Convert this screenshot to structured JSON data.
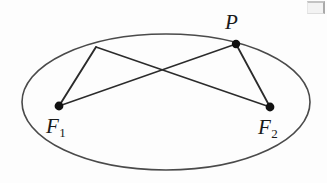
{
  "figure": {
    "type": "geometry-diagram",
    "background_color": "#fdfdfd",
    "stroke_color": "#4a4a4a",
    "line_color": "#2b2b2b",
    "point_color": "#111111",
    "label_color": "#1a1a1a",
    "ellipse": {
      "cx": 166,
      "cy": 102,
      "rx": 144,
      "ry": 68,
      "stroke_width": 1.6
    },
    "points": [
      {
        "id": "P",
        "label": "P",
        "x": 236,
        "y": 44,
        "radius": 4.2,
        "filled": true
      },
      {
        "id": "F1",
        "label": "F",
        "subscript": "1",
        "x": 59,
        "y": 106,
        "radius": 4.4,
        "filled": true
      },
      {
        "id": "F2",
        "label": "F",
        "subscript": "2",
        "x": 270,
        "y": 107,
        "radius": 4.4,
        "filled": true
      },
      {
        "id": "Q",
        "label": "",
        "x": 96,
        "y": 47,
        "radius": 0,
        "filled": false
      }
    ],
    "segments": [
      {
        "name": "segment-Q-F1",
        "from": "Q",
        "to": "F1",
        "x1": 96,
        "y1": 47,
        "x2": 59,
        "y2": 106,
        "width": 1.7
      },
      {
        "name": "segment-Q-F2",
        "from": "Q",
        "to": "F2",
        "x1": 96,
        "y1": 47,
        "x2": 270,
        "y2": 107,
        "width": 1.7
      },
      {
        "name": "segment-P-F1",
        "from": "P",
        "to": "F1",
        "x1": 236,
        "y1": 44,
        "x2": 59,
        "y2": 106,
        "width": 1.5
      },
      {
        "name": "segment-P-F2",
        "from": "P",
        "to": "F2",
        "x1": 236,
        "y1": 44,
        "x2": 270,
        "y2": 107,
        "width": 1.7
      }
    ],
    "labels": {
      "P": "P",
      "F1_base": "F",
      "F1_sub": "1",
      "F2_base": "F",
      "F2_sub": "2"
    },
    "artifact": {
      "name": "scan-artifact",
      "description": "faint grey scanned fragment in top-right corner"
    }
  }
}
